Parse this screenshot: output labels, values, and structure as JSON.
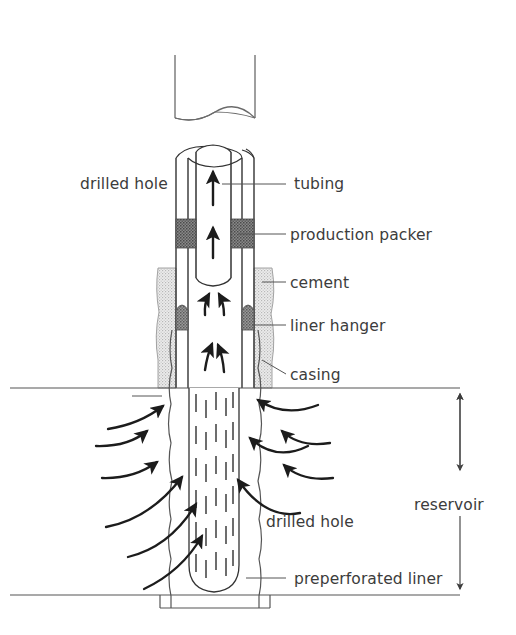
{
  "figure": {
    "type": "engineering-cross-section",
    "background_color": "#ffffff",
    "line_color": "#333333",
    "text_color": "#3c3c3c"
  },
  "labels": {
    "drilled_hole_upper": "drilled hole",
    "tubing": "tubing",
    "production_packer": "production packer",
    "cement": "cement",
    "liner_hanger": "liner hanger",
    "casing": "casing",
    "drilled_hole_lower": "drilled hole",
    "preperforated_liner": "preperforated liner",
    "reservoir": "reservoir"
  },
  "components": {
    "tubing": {
      "name": "tubing",
      "fill": "#ffffff",
      "stroke": "#333333",
      "description": "inner production string with upward flow arrows"
    },
    "casing": {
      "name": "casing",
      "fill": "#ffffff",
      "stroke": "#333333",
      "description": "outer pipe surrounding tubing"
    },
    "production_packer": {
      "name": "production-packer",
      "fill": "#6e6e6e",
      "pattern": "dark-stipple",
      "description": "dark sealing band between tubing and casing"
    },
    "cement": {
      "name": "cement",
      "fill": "#d9d9d9",
      "pattern": "light-stipple",
      "description": "light gray annulus sheath with wavy outer edge"
    },
    "liner_hanger": {
      "name": "liner-hanger",
      "fill": "#7a7a7a",
      "pattern": "dark-stipple",
      "description": "dark rounded shoulder at casing shoe"
    },
    "preperforated_liner": {
      "name": "preperforated-liner",
      "fill": "#ffffff",
      "stroke": "#333333",
      "pattern": "vertical-dashes",
      "description": "slotted liner inside reservoir with rounded bottom"
    },
    "drilled_hole": {
      "name": "drilled-hole",
      "fill": "#ffffff",
      "stroke": "#555555",
      "description": "irregular rough-walled borehole"
    },
    "broken_pipe_top": {
      "name": "broken-pipe-top",
      "description": "cut-away pipe stub at top of figure"
    }
  },
  "flow": {
    "inside_arrows_count": 6,
    "reservoir_inflow_left_count": 4,
    "reservoir_inflow_right_count": 2,
    "direction": "upward toward surface"
  },
  "reservoir_dimension": {
    "label": "reservoir",
    "arrow_style": "double-headed vertical",
    "top_boundary_y": 388,
    "bottom_boundary_y": 595
  }
}
